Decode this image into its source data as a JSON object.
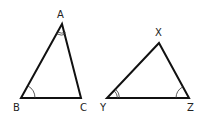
{
  "diagram": {
    "type": "geometry-similar-triangles",
    "colors": {
      "stroke": "#111111",
      "label": "#222222",
      "background": "#ffffff"
    },
    "triangles": [
      {
        "name": "ABC",
        "vertices": [
          {
            "label": "A",
            "x": 62,
            "y": 24,
            "angle_marks": 2
          },
          {
            "label": "B",
            "x": 21,
            "y": 98,
            "angle_marks": 1
          },
          {
            "label": "C",
            "x": 81,
            "y": 98,
            "angle_marks": 0
          }
        ]
      },
      {
        "name": "XYZ",
        "vertices": [
          {
            "label": "X",
            "x": 159,
            "y": 43,
            "angle_marks": 0
          },
          {
            "label": "Y",
            "x": 107,
            "y": 98,
            "angle_marks": 2
          },
          {
            "label": "Z",
            "x": 189,
            "y": 98,
            "angle_marks": 1
          }
        ]
      }
    ]
  },
  "labels": {
    "A": "A",
    "B": "B",
    "C": "C",
    "X": "X",
    "Y": "Y",
    "Z": "Z"
  }
}
